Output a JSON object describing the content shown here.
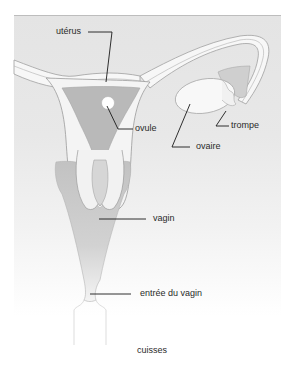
{
  "diagram": {
    "type": "anatomical-diagram",
    "labels": {
      "uterus": "utérus",
      "ovule": "ovule",
      "trompe": "trompe",
      "ovaire": "ovaire",
      "vagin": "vagin",
      "entree_vagin": "entrée du vagin",
      "cuisses": "cuisses"
    },
    "colors": {
      "panel": "#e6e6e6",
      "tissue": "#f4f4f4",
      "uterus_cavity": "#b9b9b9",
      "vagina": "#c4c4c4",
      "outline": "#9a9a9a",
      "leader_line": "#1a1a1a",
      "ovule": "#ffffff"
    }
  }
}
